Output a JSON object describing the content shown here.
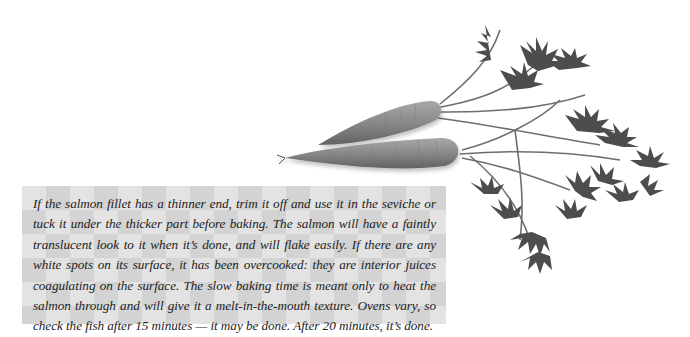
{
  "illustration": {
    "subject": "two carrots with leafy green tops",
    "colors": {
      "carrot_body": "#8a8a8a",
      "carrot_shadow": "#6a6a6a",
      "carrot_highlight": "#b0b0b0",
      "leaves": "#4a4a4a",
      "stems": "#6e6e6e"
    }
  },
  "note": {
    "text": "If the salmon fillet has a thinner end, trim it off and use it in the seviche or tuck it under the thicker part before baking. The salmon will have a faintly translucent look to it when it’s done, and will flake easily. If there are any white spots on its surface, it has been overcooked: they are interior juices coagulating on the surface. The slow baking time is meant only to heat the salmon through and will give it a melt-in-the-mouth texture. Ovens vary, so check the fish after 15 minutes — it may be done. After 20 minutes, it’s done.",
    "background": {
      "light": "#e3e3e3",
      "dark": "#d3d3d3"
    }
  }
}
